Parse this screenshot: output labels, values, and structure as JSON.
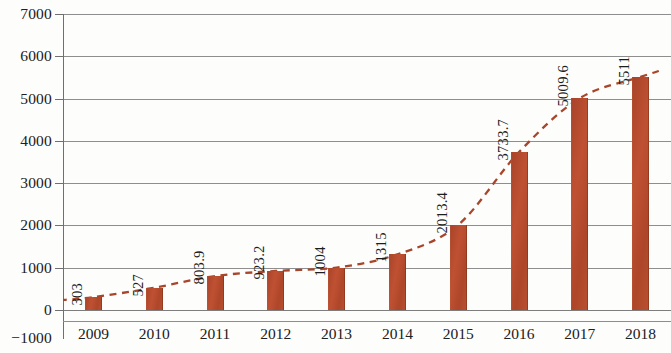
{
  "chart_data": {
    "type": "bar",
    "title": "",
    "subtitle": "",
    "xlabel": "",
    "ylabel": "",
    "categories": [
      "2009",
      "2010",
      "2011",
      "2012",
      "2013",
      "2014",
      "2015",
      "2016",
      "2017",
      "2018"
    ],
    "values": [
      303,
      527,
      803.9,
      923.2,
      1004,
      1315,
      2013.4,
      3733.7,
      5009.6,
      5511
    ],
    "value_labels": [
      "303",
      "527",
      "803.9",
      "923.2",
      "1004",
      "1315",
      "2013.4",
      "3733.7",
      "5009.6",
      "5511"
    ],
    "ylim": [
      -1000,
      7000
    ],
    "ytick_labels": [
      "7000",
      "6000",
      "5000",
      "4000",
      "3000",
      "2000",
      "1000",
      "0",
      "-1000"
    ],
    "ytick_values": [
      7000,
      6000,
      5000,
      4000,
      3000,
      2000,
      1000,
      0,
      -1000
    ],
    "grid": true,
    "legend": false,
    "bar_color": "#b24a2c",
    "grid_color": "#8e8e8e",
    "axis_color": "#6f6f6f",
    "series": [
      {
        "name": "value",
        "type": "bar",
        "values": [
          303,
          527,
          803.9,
          923.2,
          1004,
          1315,
          2013.4,
          3733.7,
          5009.6,
          5511
        ]
      },
      {
        "name": "trend",
        "type": "line",
        "style": "dashed",
        "color": "#a8452a",
        "values": [
          303,
          527,
          803.9,
          923.2,
          1004,
          1315,
          2013.4,
          3733.7,
          5009.6,
          5511
        ]
      }
    ]
  }
}
